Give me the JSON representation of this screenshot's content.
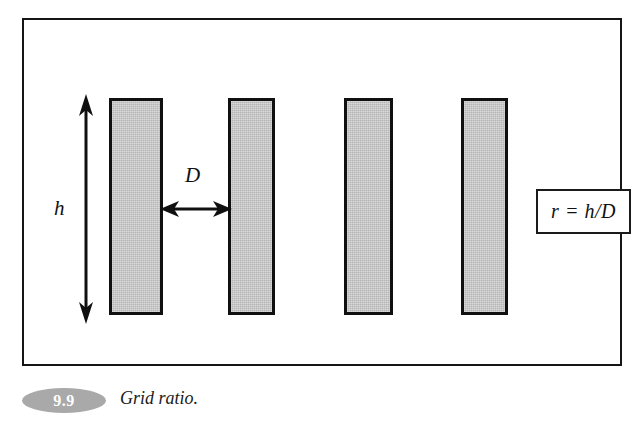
{
  "figure": {
    "frame": {
      "border_color": "#151515"
    },
    "bars": [
      {
        "name": "grid-bar-1",
        "x": 85,
        "width": 54,
        "y": 78,
        "height": 217,
        "fill": "#c2c2c2",
        "stroke": "#101010"
      },
      {
        "name": "grid-bar-2",
        "x": 204,
        "width": 47,
        "y": 78,
        "height": 217,
        "fill": "#c2c2c2",
        "stroke": "#101010"
      },
      {
        "name": "grid-bar-3",
        "x": 320,
        "width": 49,
        "y": 78,
        "height": 217,
        "fill": "#c2c2c2",
        "stroke": "#101010"
      },
      {
        "name": "grid-bar-4",
        "x": 437,
        "width": 47,
        "y": 78,
        "height": 217,
        "fill": "#c2c2c2",
        "stroke": "#101010"
      }
    ],
    "labels": {
      "height_label": "h",
      "spacing_label": "D"
    },
    "dimensions": {
      "height_arrow": {
        "orientation": "vertical",
        "double_headed": true
      },
      "spacing_arrow": {
        "orientation": "horizontal",
        "double_headed": true
      }
    },
    "formula": {
      "text": "r = h/D",
      "ratio_symbol": "r",
      "numerator": "h",
      "denominator": "D"
    },
    "icons": {
      "arrow_vertical": "double-arrow-vertical-icon",
      "arrow_horizontal": "double-arrow-horizontal-icon"
    }
  },
  "caption": {
    "number": "9.9",
    "text": "Grid ratio.",
    "badge_color": "#a9a9a9",
    "number_color": "#ffffff"
  }
}
